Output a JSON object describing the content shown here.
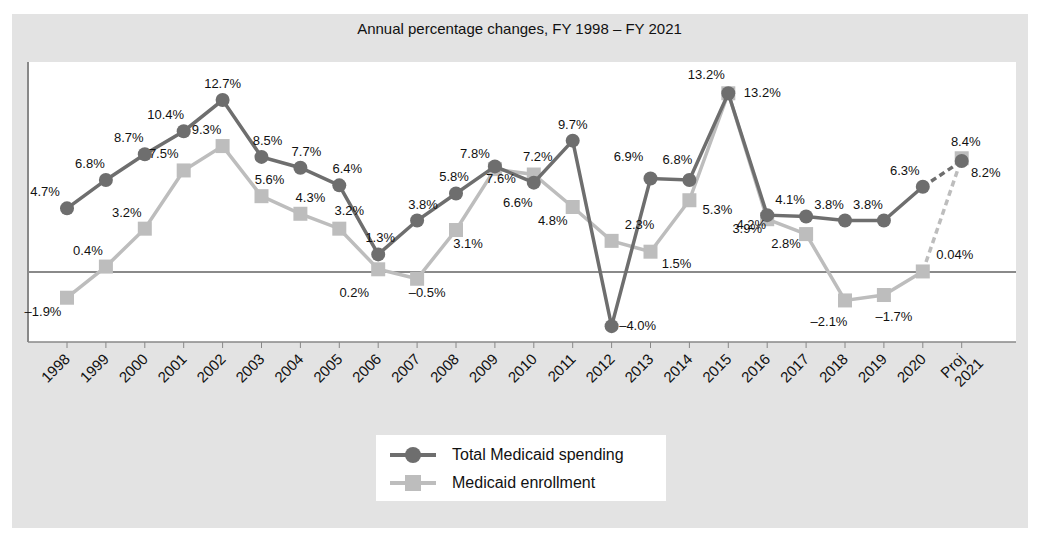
{
  "chart_data": {
    "type": "line",
    "title": "Annual percentage changes, FY 1998 – FY 2021",
    "xlabel": "",
    "ylabel": "",
    "categories": [
      "1998",
      "1999",
      "2000",
      "2001",
      "2002",
      "2003",
      "2004",
      "2005",
      "2006",
      "2007",
      "2008",
      "2009",
      "2010",
      "2011",
      "2012",
      "2013",
      "2014",
      "2015",
      "2016",
      "2017",
      "2018",
      "2019",
      "2020",
      "Proj 2021"
    ],
    "series": [
      {
        "name": "Total Medicaid spending",
        "marker": "circle",
        "color": "#6e6e6e",
        "values": [
          4.7,
          6.8,
          8.7,
          10.4,
          12.7,
          8.5,
          7.7,
          6.4,
          1.3,
          3.8,
          5.8,
          7.8,
          6.6,
          9.7,
          -4.0,
          6.9,
          6.8,
          13.2,
          4.2,
          4.1,
          3.8,
          3.8,
          6.3,
          8.2
        ],
        "labels": [
          "4.7%",
          "6.8%",
          "8.7%",
          "10.4%",
          "12.7%",
          "8.5%",
          "7.7%",
          "6.4%",
          "1.3%",
          "3.8%",
          "5.8%",
          "7.8%",
          "6.6%",
          "9.7%",
          "–4.0%",
          "6.9%",
          "6.8%",
          "13.2%",
          "4.2%",
          "4.1%",
          "3.8%",
          "3.8%",
          "6.3%",
          "8.2%"
        ],
        "projected_from_index": 22
      },
      {
        "name": "Medicaid enrollment",
        "marker": "square",
        "color": "#bdbdbd",
        "values": [
          -1.9,
          0.4,
          3.2,
          7.5,
          9.3,
          5.6,
          4.3,
          3.2,
          0.2,
          -0.5,
          3.1,
          7.6,
          7.2,
          4.8,
          2.3,
          1.5,
          5.3,
          13.2,
          3.9,
          2.8,
          -2.1,
          -1.7,
          0.04,
          8.4
        ],
        "labels": [
          "–1.9%",
          "0.4%",
          "3.2%",
          "7.5%",
          "9.3%",
          "5.6%",
          "4.3%",
          "3.2%",
          "0.2%",
          "–0.5%",
          "3.1%",
          "7.6%",
          "7.2%",
          "4.8%",
          "2.3%",
          "1.5%",
          "5.3%",
          "13.2%",
          "3.9%",
          "2.8%",
          "–2.1%",
          "–1.7%",
          "0.04%",
          "8.4%"
        ],
        "projected_from_index": 22
      }
    ],
    "ylim": [
      -5,
      15
    ],
    "grid": false,
    "zero_line": true,
    "legend_position": "bottom-center"
  },
  "legend": {
    "items": [
      {
        "label": "Total Medicaid spending"
      },
      {
        "label": "Medicaid enrollment"
      }
    ]
  }
}
